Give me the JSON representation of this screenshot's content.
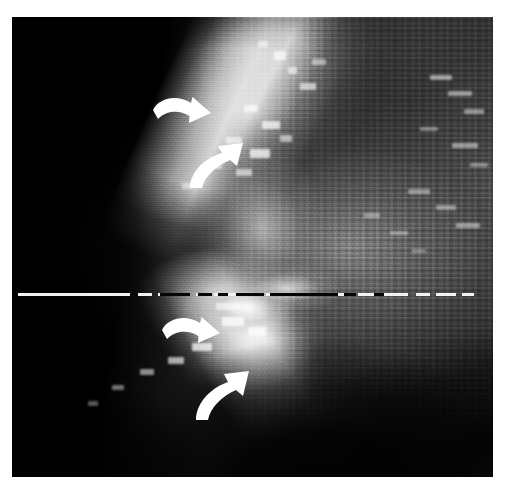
{
  "figure": {
    "kind": "grayscale-scan-image",
    "caption": "",
    "plate": {
      "left": 12,
      "top": 17,
      "width": 481,
      "height": 460,
      "background_color": "#000000",
      "page_background": "#ffffff"
    }
  },
  "colors": {
    "page_background": "#ffffff",
    "plate_background": "#000000",
    "annotation": "#ffffff",
    "baseline_light": "#f2f2f2",
    "baseline_dark": "#050505",
    "highlight": "#ffffff",
    "midtone": "#6b6b6b",
    "shadow": "#000000"
  },
  "baseline": {
    "name": "horizontal-dashed-reference-line",
    "y": 276,
    "thickness": 3,
    "style": "dashed",
    "segments": [
      {
        "x": 6,
        "w": 112,
        "tone": "light"
      },
      {
        "x": 126,
        "w": 14,
        "tone": "light"
      },
      {
        "x": 146,
        "w": 10,
        "tone": "light"
      },
      {
        "x": 162,
        "w": 16,
        "tone": "light"
      },
      {
        "x": 184,
        "w": 12,
        "tone": "light"
      },
      {
        "x": 202,
        "w": 22,
        "tone": "light"
      },
      {
        "x": 230,
        "w": 18,
        "tone": "light"
      },
      {
        "x": 254,
        "w": 26,
        "tone": "light"
      },
      {
        "x": 286,
        "w": 10,
        "tone": "light"
      },
      {
        "x": 302,
        "w": 18,
        "tone": "light"
      },
      {
        "x": 326,
        "w": 8,
        "tone": "light"
      },
      {
        "x": 148,
        "w": 30,
        "tone": "dark"
      },
      {
        "x": 186,
        "w": 14,
        "tone": "dark"
      },
      {
        "x": 206,
        "w": 10,
        "tone": "dark"
      },
      {
        "x": 224,
        "w": 28,
        "tone": "dark"
      },
      {
        "x": 258,
        "w": 68,
        "tone": "dark"
      },
      {
        "x": 332,
        "w": 12,
        "tone": "dark"
      },
      {
        "x": 352,
        "w": 22,
        "tone": "dark"
      },
      {
        "x": 380,
        "w": 10,
        "tone": "dark"
      },
      {
        "x": 346,
        "w": 16,
        "tone": "light"
      },
      {
        "x": 372,
        "w": 24,
        "tone": "light"
      },
      {
        "x": 404,
        "w": 14,
        "tone": "light"
      },
      {
        "x": 424,
        "w": 20,
        "tone": "light"
      },
      {
        "x": 450,
        "w": 12,
        "tone": "light"
      }
    ]
  },
  "annotations": {
    "description": "four white curved arrows marking interfaces",
    "arrows": [
      {
        "id": "arrow-upper-left",
        "label": "upper curved arrow pointing down-right",
        "left": 139,
        "top": 76,
        "width": 62,
        "height": 44,
        "direction": "down-right",
        "curve": "clockwise"
      },
      {
        "id": "arrow-upper-right",
        "label": "upper curved arrow pointing up-right",
        "left": 172,
        "top": 124,
        "width": 62,
        "height": 48,
        "direction": "up-right",
        "curve": "counter-clockwise"
      },
      {
        "id": "arrow-lower-left",
        "label": "lower curved arrow pointing down-right",
        "left": 148,
        "top": 296,
        "width": 62,
        "height": 44,
        "direction": "down-right",
        "curve": "clockwise"
      },
      {
        "id": "arrow-lower-right",
        "label": "lower curved arrow pointing up-right",
        "left": 178,
        "top": 352,
        "width": 62,
        "height": 52,
        "direction": "up-right",
        "curve": "counter-clockwise"
      }
    ]
  },
  "specks": [
    {
      "x": 262,
      "y": 34,
      "w": 12,
      "h": 9,
      "a": 0.8
    },
    {
      "x": 276,
      "y": 50,
      "w": 9,
      "h": 7,
      "a": 0.7
    },
    {
      "x": 246,
      "y": 24,
      "w": 10,
      "h": 6,
      "a": 0.62
    },
    {
      "x": 300,
      "y": 42,
      "w": 14,
      "h": 6,
      "a": 0.58
    },
    {
      "x": 288,
      "y": 66,
      "w": 16,
      "h": 7,
      "a": 0.72
    },
    {
      "x": 232,
      "y": 88,
      "w": 14,
      "h": 7,
      "a": 0.78
    },
    {
      "x": 250,
      "y": 104,
      "w": 18,
      "h": 8,
      "a": 0.86
    },
    {
      "x": 214,
      "y": 120,
      "w": 16,
      "h": 7,
      "a": 0.74
    },
    {
      "x": 238,
      "y": 132,
      "w": 20,
      "h": 9,
      "a": 0.88
    },
    {
      "x": 268,
      "y": 118,
      "w": 12,
      "h": 7,
      "a": 0.66
    },
    {
      "x": 196,
      "y": 146,
      "w": 14,
      "h": 6,
      "a": 0.6
    },
    {
      "x": 224,
      "y": 152,
      "w": 16,
      "h": 7,
      "a": 0.7
    },
    {
      "x": 170,
      "y": 166,
      "w": 12,
      "h": 6,
      "a": 0.5
    },
    {
      "x": 418,
      "y": 58,
      "w": 22,
      "h": 5,
      "a": 0.62
    },
    {
      "x": 436,
      "y": 74,
      "w": 24,
      "h": 5,
      "a": 0.58
    },
    {
      "x": 452,
      "y": 92,
      "w": 20,
      "h": 5,
      "a": 0.54
    },
    {
      "x": 408,
      "y": 110,
      "w": 18,
      "h": 4,
      "a": 0.46
    },
    {
      "x": 440,
      "y": 126,
      "w": 26,
      "h": 5,
      "a": 0.56
    },
    {
      "x": 458,
      "y": 146,
      "w": 18,
      "h": 4,
      "a": 0.48
    },
    {
      "x": 396,
      "y": 172,
      "w": 22,
      "h": 5,
      "a": 0.52
    },
    {
      "x": 424,
      "y": 188,
      "w": 20,
      "h": 5,
      "a": 0.5
    },
    {
      "x": 444,
      "y": 206,
      "w": 24,
      "h": 5,
      "a": 0.54
    },
    {
      "x": 352,
      "y": 196,
      "w": 16,
      "h": 5,
      "a": 0.44
    },
    {
      "x": 378,
      "y": 214,
      "w": 18,
      "h": 4,
      "a": 0.42
    },
    {
      "x": 400,
      "y": 232,
      "w": 14,
      "h": 4,
      "a": 0.38
    },
    {
      "x": 210,
      "y": 300,
      "w": 22,
      "h": 9,
      "a": 0.9
    },
    {
      "x": 236,
      "y": 310,
      "w": 18,
      "h": 8,
      "a": 0.82
    },
    {
      "x": 180,
      "y": 326,
      "w": 20,
      "h": 8,
      "a": 0.86
    },
    {
      "x": 156,
      "y": 340,
      "w": 16,
      "h": 7,
      "a": 0.74
    },
    {
      "x": 128,
      "y": 352,
      "w": 14,
      "h": 6,
      "a": 0.62
    },
    {
      "x": 100,
      "y": 368,
      "w": 12,
      "h": 5,
      "a": 0.5
    },
    {
      "x": 76,
      "y": 384,
      "w": 10,
      "h": 5,
      "a": 0.4
    },
    {
      "x": 204,
      "y": 286,
      "w": 24,
      "h": 7,
      "a": 0.7
    }
  ]
}
